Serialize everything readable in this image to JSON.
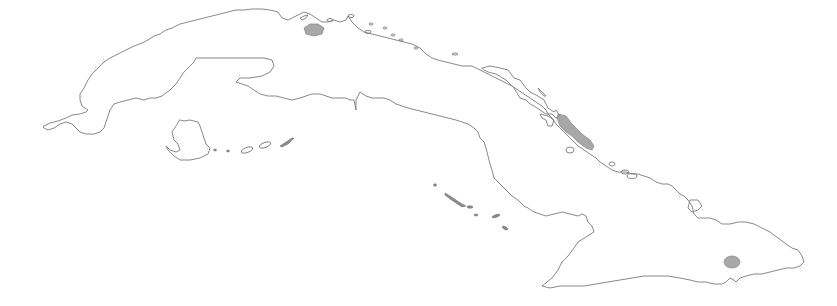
{
  "map": {
    "subject": "Cuba outline map",
    "colors": {
      "background": "#ffffff",
      "coastline": "#7a7a7a",
      "highlighted_region": "#9a9a9a"
    },
    "highlighted_regions": [
      {
        "id": "region-west-north-coast",
        "approx_center_px": [
          313,
          32
        ]
      },
      {
        "id": "region-central-north-cays",
        "approx_center_px": [
          575,
          132
        ]
      },
      {
        "id": "region-east-south-coast",
        "approx_center_px": [
          732,
          262
        ]
      }
    ],
    "features": [
      "main-island-coastline",
      "isla-de-la-juventud",
      "southern-cays-west",
      "southern-cays-central",
      "northern-cays"
    ]
  }
}
